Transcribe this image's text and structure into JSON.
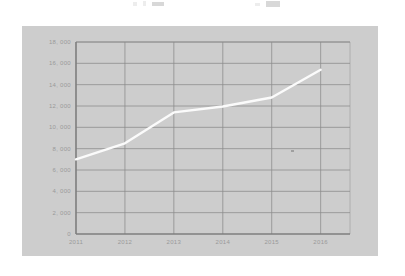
{
  "page": {
    "background_color": "#ffffff",
    "panel_color": "#cdcdcd",
    "grid_color": "#8c8c8c",
    "axis_color": "#7e7e7e",
    "line_color": "#fbfbfb",
    "tick_label_color": "#9a9a9a"
  },
  "top_artifacts": [
    {
      "left": 133,
      "top": 2,
      "width": 4,
      "height": 4
    },
    {
      "left": 143,
      "top": 1,
      "width": 3,
      "height": 5
    },
    {
      "left": 152,
      "top": 2,
      "width": 12,
      "height": 4
    },
    {
      "left": 255,
      "top": 3,
      "width": 5,
      "height": 3
    },
    {
      "left": 266,
      "top": 1,
      "width": 14,
      "height": 6
    }
  ],
  "chart_data": {
    "type": "line",
    "title": "",
    "xlabel": "",
    "ylabel": "",
    "categories": [
      "2011",
      "2012",
      "2013",
      "2014",
      "2015",
      "2016"
    ],
    "x": [
      2011,
      2012,
      2013,
      2014,
      2015,
      2016
    ],
    "values": [
      7000,
      8500,
      11400,
      11950,
      12800,
      15400
    ],
    "series": [
      {
        "name": "",
        "color": "#fbfbfb",
        "values": [
          7000,
          8500,
          11400,
          11950,
          12800,
          15400
        ]
      }
    ],
    "ylim": [
      0,
      18000
    ],
    "xlim": [
      2011,
      2016.6
    ],
    "y_ticks": [
      0,
      2000,
      4000,
      6000,
      8000,
      10000,
      12000,
      14000,
      16000,
      18000
    ],
    "y_tick_labels": [
      "0",
      "2, 000",
      "4, 000",
      "6, 000",
      "8, 000",
      "10, 000",
      "12, 000",
      "14, 000",
      "16, 000",
      "18, 000"
    ],
    "x_ticks": [
      2011,
      2012,
      2013,
      2014,
      2015,
      2016
    ],
    "x_tick_labels": [
      "2011",
      "2012",
      "2013",
      "2014",
      "2015",
      "2016"
    ],
    "grid": true,
    "grid_axes": "both",
    "legend": false,
    "legend_position": "none",
    "markers": false,
    "line_width": 2.4
  },
  "speck": {
    "left_pct": 78.5,
    "top_pct": 56.0
  }
}
